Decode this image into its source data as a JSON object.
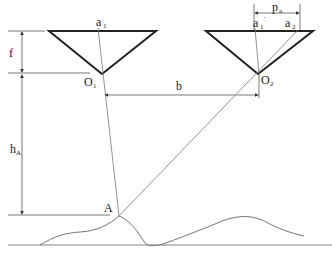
{
  "diagram": {
    "labels": {
      "a1": {
        "main": "a",
        "sub": "1"
      },
      "a1_prime": {
        "main": "a",
        "sub": "1",
        "sup": "'"
      },
      "a2": {
        "main": "a",
        "sub": "2"
      },
      "pa": {
        "main": "p",
        "sub": "a"
      },
      "f": {
        "main": "f"
      },
      "O1": {
        "main": "O",
        "sub": "1"
      },
      "O2": {
        "main": "O",
        "sub": "2"
      },
      "b": {
        "main": "b"
      },
      "hA": {
        "main": "h",
        "sub": "A"
      },
      "A": {
        "main": "A"
      }
    },
    "elements": [
      "left-camera-triangle",
      "right-camera-triangle",
      "focal-length-dimension",
      "height-dimension",
      "baseline-dimension",
      "parallax-dimension",
      "ray-a1-to-A",
      "ray-a2-to-A",
      "terrain-profile",
      "ground-line"
    ]
  }
}
